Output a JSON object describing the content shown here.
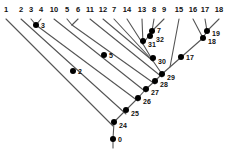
{
  "figure": {
    "kind": "cladogram",
    "background_color": "#ffffff",
    "line_color": "#555555",
    "node_color": "#000000",
    "text_color": "#111111",
    "width": 229,
    "height": 152
  },
  "leaves": [
    {
      "label": "1",
      "x": 6,
      "y": 13
    },
    {
      "label": "2",
      "x": 21,
      "y": 13
    },
    {
      "label": "3",
      "x": 31,
      "y": 13
    },
    {
      "label": "4",
      "x": 41,
      "y": 13
    },
    {
      "label": "10",
      "x": 54,
      "y": 13
    },
    {
      "label": "5",
      "x": 67,
      "y": 13
    },
    {
      "label": "6",
      "x": 78,
      "y": 13
    },
    {
      "label": "11",
      "x": 90,
      "y": 13
    },
    {
      "label": "12",
      "x": 103,
      "y": 13
    },
    {
      "label": "7",
      "x": 114,
      "y": 13
    },
    {
      "label": "14",
      "x": 127,
      "y": 13
    },
    {
      "label": "13",
      "x": 142,
      "y": 13
    },
    {
      "label": "8",
      "x": 154,
      "y": 13
    },
    {
      "label": "9",
      "x": 164,
      "y": 13
    },
    {
      "label": "15",
      "x": 179,
      "y": 13
    },
    {
      "label": "16",
      "x": 193,
      "y": 13
    },
    {
      "label": "17",
      "x": 205,
      "y": 13
    },
    {
      "label": "18",
      "x": 219,
      "y": 13
    }
  ],
  "nodes": [
    {
      "label": "0",
      "x": 113,
      "y": 139,
      "lx": 118,
      "ly": 136
    },
    {
      "label": "2",
      "x": 73,
      "y": 71,
      "lx": 78,
      "ly": 68
    },
    {
      "label": "3",
      "x": 36,
      "y": 25,
      "lx": 41,
      "ly": 22
    },
    {
      "label": "5",
      "x": 104,
      "y": 55,
      "lx": 109,
      "ly": 52
    },
    {
      "label": "7",
      "x": 152,
      "y": 31,
      "lx": 157,
      "ly": 27
    },
    {
      "label": "17",
      "x": 181,
      "y": 57,
      "lx": 186,
      "ly": 54
    },
    {
      "label": "18",
      "x": 203,
      "y": 38,
      "lx": 208,
      "ly": 38
    },
    {
      "label": "19",
      "x": 207,
      "y": 31,
      "lx": 212,
      "ly": 30
    },
    {
      "label": "24",
      "x": 114,
      "y": 122,
      "lx": 119,
      "ly": 122
    },
    {
      "label": "25",
      "x": 126,
      "y": 110,
      "lx": 131,
      "ly": 110
    },
    {
      "label": "26",
      "x": 138,
      "y": 98,
      "lx": 143,
      "ly": 98
    },
    {
      "label": "27",
      "x": 146,
      "y": 89,
      "lx": 151,
      "ly": 89
    },
    {
      "label": "28",
      "x": 155,
      "y": 81,
      "lx": 160,
      "ly": 81
    },
    {
      "label": "29",
      "x": 162,
      "y": 74,
      "lx": 167,
      "ly": 74
    },
    {
      "label": "30",
      "x": 153,
      "y": 58,
      "lx": 158,
      "ly": 58
    },
    {
      "label": "31",
      "x": 143,
      "y": 41,
      "lx": 148,
      "ly": 41
    },
    {
      "label": "32",
      "x": 150,
      "y": 36,
      "lx": 156,
      "ly": 36
    }
  ],
  "branches": [
    {
      "name": "leaf-1-branch",
      "x1": 6,
      "y1": 19,
      "x2": 113,
      "y2": 126
    },
    {
      "name": "leaf-2-branch",
      "x1": 21,
      "y1": 19,
      "x2": 126,
      "y2": 114
    },
    {
      "name": "leaf-3-branch",
      "x1": 31,
      "y1": 19,
      "x2": 36,
      "y2": 25
    },
    {
      "name": "leaf-4-branch",
      "x1": 41,
      "y1": 19,
      "x2": 36,
      "y2": 25
    },
    {
      "name": "node-3-branch",
      "x1": 36,
      "y1": 25,
      "x2": 138,
      "y2": 101
    },
    {
      "name": "leaf-10-branch",
      "x1": 54,
      "y1": 19,
      "x2": 146,
      "y2": 92
    },
    {
      "name": "leaf-5-branch",
      "x1": 67,
      "y1": 19,
      "x2": 72,
      "y2": 25
    },
    {
      "name": "leaf-6-branch",
      "x1": 78,
      "y1": 19,
      "x2": 72,
      "y2": 25
    },
    {
      "name": "node-5-branch",
      "x1": 72,
      "y1": 25,
      "x2": 155,
      "y2": 84
    },
    {
      "name": "leaf-11-branch",
      "x1": 90,
      "y1": 19,
      "x2": 162,
      "y2": 77
    },
    {
      "name": "leaf-12-branch",
      "x1": 103,
      "y1": 19,
      "x2": 153,
      "y2": 61
    },
    {
      "name": "leaf-7-branch",
      "x1": 114,
      "y1": 19,
      "x2": 153,
      "y2": 61
    },
    {
      "name": "leaf-14-branch",
      "x1": 127,
      "y1": 19,
      "x2": 143,
      "y2": 44
    },
    {
      "name": "leaf-13-branch",
      "x1": 142,
      "y1": 19,
      "x2": 143,
      "y2": 44
    },
    {
      "name": "leaf-8-branch",
      "x1": 154,
      "y1": 19,
      "x2": 152,
      "y2": 31
    },
    {
      "name": "leaf-9-branch",
      "x1": 164,
      "y1": 19,
      "x2": 152,
      "y2": 31
    },
    {
      "name": "node-7-branch",
      "x1": 152,
      "y1": 31,
      "x2": 143,
      "y2": 44
    },
    {
      "name": "node-31-branch",
      "x1": 143,
      "y1": 44,
      "x2": 153,
      "y2": 61
    },
    {
      "name": "node-30-branch",
      "x1": 153,
      "y1": 61,
      "x2": 162,
      "y2": 74
    },
    {
      "name": "node-29-branch",
      "x1": 162,
      "y1": 74,
      "x2": 155,
      "y2": 81
    },
    {
      "name": "node-28-branch",
      "x1": 155,
      "y1": 81,
      "x2": 146,
      "y2": 89
    },
    {
      "name": "node-27-branch",
      "x1": 146,
      "y1": 89,
      "x2": 138,
      "y2": 98
    },
    {
      "name": "node-26-branch",
      "x1": 138,
      "y1": 98,
      "x2": 126,
      "y2": 110
    },
    {
      "name": "node-25-branch",
      "x1": 126,
      "y1": 110,
      "x2": 114,
      "y2": 122
    },
    {
      "name": "node-24-stem",
      "x1": 114,
      "y1": 122,
      "x2": 113,
      "y2": 139
    },
    {
      "name": "root-stem",
      "x1": 113,
      "y1": 139,
      "x2": 113,
      "y2": 148
    },
    {
      "name": "node-17-branch",
      "x1": 162,
      "y1": 74,
      "x2": 203,
      "y2": 38
    },
    {
      "name": "leaf-15-branch",
      "x1": 179,
      "y1": 19,
      "x2": 170,
      "y2": 67
    },
    {
      "name": "leaf-16-branch",
      "x1": 193,
      "y1": 19,
      "x2": 203,
      "y2": 38
    },
    {
      "name": "leaf-17-branch",
      "x1": 205,
      "y1": 19,
      "x2": 207,
      "y2": 31
    },
    {
      "name": "leaf-18-branch",
      "x1": 219,
      "y1": 19,
      "x2": 207,
      "y2": 31
    },
    {
      "name": "node-19-branch",
      "x1": 207,
      "y1": 31,
      "x2": 203,
      "y2": 38
    }
  ]
}
